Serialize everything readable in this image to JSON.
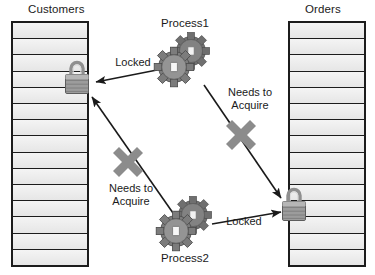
{
  "diagram": {
    "colors": {
      "table_fill": "#eeeeee",
      "table_border": "#1c1c1c",
      "gear_body": "#8a8a8a",
      "gear_dark": "#6b6b6b",
      "lock_body": "#9a9a9a",
      "lock_shackle": "#b0b0b0",
      "arrow": "#1a1a1a",
      "blocker": "#8c8c8c",
      "text": "#1a1a1a",
      "background": "#ffffff"
    },
    "tables": [
      {
        "id": "customers-table",
        "label": "Customers",
        "rows": 15,
        "lock_state": "locked"
      },
      {
        "id": "orders-table",
        "label": "Orders",
        "rows": 15,
        "lock_state": "locked"
      }
    ],
    "processes": [
      {
        "id": "process1",
        "label": "Process1"
      },
      {
        "id": "process2",
        "label": "Process2"
      }
    ],
    "locks": [
      {
        "id": "customers-lock",
        "owner": "Process1",
        "on_table": "Customers"
      },
      {
        "id": "orders-lock",
        "owner": "Process2",
        "on_table": "Orders"
      }
    ],
    "edges": [
      {
        "id": "p1-locks-customers",
        "from": "Process1",
        "to": "Customers",
        "label": "Locked",
        "blocked": false
      },
      {
        "id": "p1-needs-orders",
        "from": "Process1",
        "to": "Orders",
        "label": "Needs to\nAcquire",
        "blocked": true
      },
      {
        "id": "p2-locks-orders",
        "from": "Process2",
        "to": "Orders",
        "label": "Locked",
        "blocked": false
      },
      {
        "id": "p2-needs-customers",
        "from": "Process2",
        "to": "Customers",
        "label": "Needs to\nAcquire",
        "blocked": true
      }
    ]
  }
}
